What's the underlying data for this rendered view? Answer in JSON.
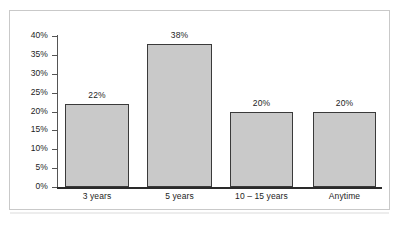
{
  "chart_data": {
    "type": "bar",
    "title": "",
    "subtitle": "",
    "xlabel": "",
    "ylabel": "",
    "categories": [
      "3 years",
      "5 years",
      "10 – 15 years",
      "Anytime"
    ],
    "values": [
      22,
      38,
      20,
      20
    ],
    "value_labels": [
      "22%",
      "38%",
      "20%",
      "20%"
    ],
    "ylim": [
      0,
      40
    ],
    "ytick_values": [
      40,
      35,
      30,
      25,
      20,
      15,
      10,
      5,
      0
    ],
    "ytick_labels": [
      "40%",
      "35%",
      "30%",
      "25%",
      "20%",
      "15%",
      "10%",
      "5%",
      "0%"
    ],
    "grid": false,
    "legend": null,
    "legend_position": "none",
    "annotations": [],
    "colors": {
      "bar_fill": "#c9c9c9",
      "bar_border": "#3a3a3a",
      "axis": "#2a2a2a",
      "tick": "#555555",
      "text": "#1d1d1d",
      "frame": "#c9c9c9",
      "background": "#ffffff"
    }
  }
}
